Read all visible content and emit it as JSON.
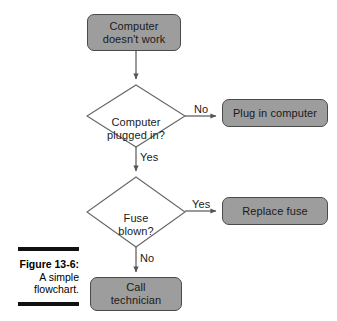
{
  "figure": {
    "caption_number": "Figure 13-6:",
    "caption_line2": "A simple",
    "caption_line3": "flowchart."
  },
  "colors": {
    "node_fill": "#9d9d9d",
    "node_border": "#4a4a4a",
    "connector": "#555555",
    "text": "#1a1a1a",
    "background": "#ffffff",
    "caption_rule": "#111111"
  },
  "flowchart": {
    "nodes": [
      {
        "id": "start",
        "type": "process",
        "label": "Computer\ndoesn't work"
      },
      {
        "id": "plugged",
        "type": "decision",
        "label": "Computer\nplugged in?"
      },
      {
        "id": "plug-in",
        "type": "process",
        "label": "Plug in computer"
      },
      {
        "id": "fuse",
        "type": "decision",
        "label": "Fuse\nblown?"
      },
      {
        "id": "replace-fuse",
        "type": "process",
        "label": "Replace fuse"
      },
      {
        "id": "call-tech",
        "type": "process",
        "label": "Call\ntechnician"
      }
    ],
    "edges": [
      {
        "from": "start",
        "to": "plugged",
        "label": ""
      },
      {
        "from": "plugged",
        "to": "plug-in",
        "label": "No"
      },
      {
        "from": "plugged",
        "to": "fuse",
        "label": "Yes"
      },
      {
        "from": "fuse",
        "to": "replace-fuse",
        "label": "Yes"
      },
      {
        "from": "fuse",
        "to": "call-tech",
        "label": "No"
      }
    ],
    "edge_labels": {
      "plugged_no": "No",
      "plugged_yes": "Yes",
      "fuse_yes": "Yes",
      "fuse_no": "No"
    }
  }
}
